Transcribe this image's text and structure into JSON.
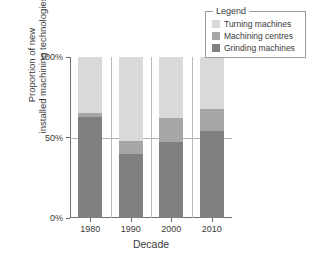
{
  "chart_data": {
    "type": "bar",
    "stacked": true,
    "title": "",
    "xlabel": "Decade",
    "ylabel": "Proportion of new installed machining technologies",
    "ylabel_lines": [
      "Proportion of new",
      "installed machining technologies"
    ],
    "categories": [
      "1980",
      "1990",
      "2000",
      "2010"
    ],
    "ylim": [
      0,
      100
    ],
    "ytick_labels": [
      "0%",
      "50%",
      "100%"
    ],
    "ytick_values": [
      0,
      50,
      100
    ],
    "grid": "horizontal-50-only",
    "legend_position": "top-right",
    "legend_title": "Legend",
    "series": [
      {
        "name": "Grinding machines",
        "color": "#808080",
        "values": [
          63,
          40,
          47,
          54
        ]
      },
      {
        "name": "Machining centres",
        "color": "#a6a6a6",
        "values": [
          2,
          8,
          15,
          14
        ]
      },
      {
        "name": "Turning machines",
        "color": "#d9d9d9",
        "values": [
          35,
          52,
          38,
          32
        ]
      }
    ]
  },
  "legend": {
    "title": "Legend",
    "items": [
      {
        "label": "Turning machines",
        "color": "#d9d9d9"
      },
      {
        "label": "Machining centres",
        "color": "#a6a6a6"
      },
      {
        "label": "Grinding machines",
        "color": "#808080"
      }
    ]
  },
  "axes": {
    "x_title": "Decade",
    "y_title_line1": "Proportion of new",
    "y_title_line2": "installed machining technologies",
    "y_ticks": [
      "100%",
      "50%",
      "0%"
    ],
    "x_ticks": [
      "1980",
      "1990",
      "2000",
      "2010"
    ]
  },
  "colors": {
    "light_gray": "#d9d9d9",
    "medium_gray": "#a6a6a6",
    "dark_gray": "#808080",
    "axis": "#6e6e6e",
    "grid": "#b3b3b3",
    "text": "#3a3a3a",
    "background": "#ffffff"
  }
}
